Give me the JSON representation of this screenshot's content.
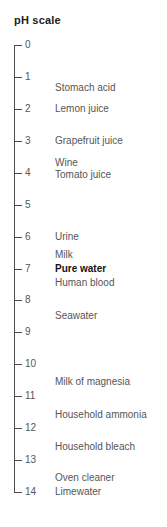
{
  "title": "pH scale",
  "colors": {
    "background": "#ffffff",
    "axis_line": "#4d4d4d",
    "label_text": "#565656",
    "bold_text": "#141414"
  },
  "axis": {
    "min": 0,
    "max": 14,
    "ticks": [
      {
        "value": 0,
        "label": "0"
      },
      {
        "value": 1,
        "label": "1"
      },
      {
        "value": 2,
        "label": "2"
      },
      {
        "value": 3,
        "label": "3"
      },
      {
        "value": 4,
        "label": "4"
      },
      {
        "value": 5,
        "label": "5"
      },
      {
        "value": 6,
        "label": "6"
      },
      {
        "value": 7,
        "label": "7"
      },
      {
        "value": 8,
        "label": "8"
      },
      {
        "value": 9,
        "label": "9"
      },
      {
        "value": 10,
        "label": "10"
      },
      {
        "value": 11,
        "label": "11"
      },
      {
        "value": 12,
        "label": "12"
      },
      {
        "value": 13,
        "label": "13"
      },
      {
        "value": 14,
        "label": "14"
      }
    ]
  },
  "substances": [
    {
      "text": "Stomach acid",
      "ph": 1.35,
      "bold": false
    },
    {
      "text": "Lemon juice",
      "ph": 2.0,
      "bold": false
    },
    {
      "text": "Grapefruit juice",
      "ph": 3.0,
      "bold": false
    },
    {
      "text": "Wine",
      "ph": 3.7,
      "bold": false
    },
    {
      "text": "Tomato juice",
      "ph": 4.08,
      "bold": false
    },
    {
      "text": "Urine",
      "ph": 6.0,
      "bold": false
    },
    {
      "text": "Milk",
      "ph": 6.58,
      "bold": false
    },
    {
      "text": "Pure water",
      "ph": 7.0,
      "bold": true
    },
    {
      "text": "Human blood",
      "ph": 7.45,
      "bold": false
    },
    {
      "text": "Seawater",
      "ph": 8.5,
      "bold": false
    },
    {
      "text": "Milk of magnesia",
      "ph": 10.55,
      "bold": false
    },
    {
      "text": "Household ammonia",
      "ph": 11.6,
      "bold": false
    },
    {
      "text": "Household bleach",
      "ph": 12.6,
      "bold": false
    },
    {
      "text": "Oven cleaner",
      "ph": 13.55,
      "bold": false
    },
    {
      "text": "Limewater",
      "ph": 14.0,
      "bold": false
    }
  ]
}
